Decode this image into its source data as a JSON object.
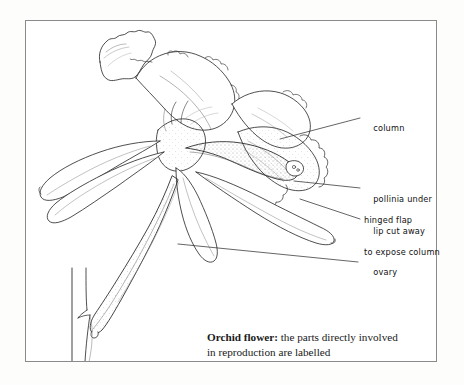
{
  "figure": {
    "type": "botanical-line-illustration",
    "subject": "Orchid flower",
    "frame_color": "#8a8a8a",
    "ink_color": "#222222",
    "background_color": "#ffffff"
  },
  "labels": [
    {
      "id": "column",
      "line1": "column",
      "line2": ""
    },
    {
      "id": "pollinia",
      "line1": "pollinia under",
      "line2": "hinged flap"
    },
    {
      "id": "lip",
      "line1": "lip cut away",
      "line2": "to expose column"
    },
    {
      "id": "ovary",
      "line1": "ovary",
      "line2": ""
    }
  ],
  "caption": {
    "lead": "Orchid flower:",
    "rest": " the parts directly involved",
    "line2": "in reproduction are labelled"
  }
}
